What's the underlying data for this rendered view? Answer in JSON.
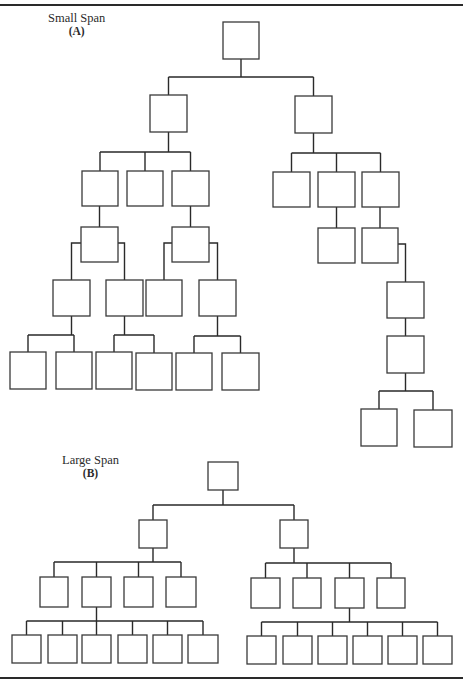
{
  "diagrams": [
    {
      "id": "small-span",
      "title": "Small Span",
      "sub": "(A)",
      "label_pos": [
        48,
        12
      ],
      "boxes": {
        "a0": [
          223,
          22,
          36,
          37
        ],
        "a1": [
          150,
          95,
          37,
          37
        ],
        "a2": [
          295,
          96,
          37,
          37
        ],
        "a3": [
          82,
          171,
          36,
          35
        ],
        "a4": [
          127,
          171,
          36,
          35
        ],
        "a5": [
          172,
          171,
          37,
          35
        ],
        "a6": [
          273,
          172,
          37,
          35
        ],
        "a7": [
          318,
          172,
          37,
          35
        ],
        "a8": [
          362,
          172,
          37,
          35
        ],
        "a9": [
          81,
          227,
          37,
          35
        ],
        "a10": [
          172,
          227,
          37,
          35
        ],
        "a11": [
          318,
          228,
          37,
          35
        ],
        "a12": [
          362,
          228,
          36,
          35
        ],
        "a13": [
          53,
          280,
          37,
          36
        ],
        "a14": [
          106,
          280,
          37,
          36
        ],
        "a15": [
          146,
          280,
          36,
          36
        ],
        "a16": [
          199,
          280,
          37,
          36
        ],
        "a17": [
          387,
          282,
          37,
          36
        ],
        "a18": [
          10,
          352,
          36,
          37
        ],
        "a19": [
          56,
          352,
          36,
          37
        ],
        "a20": [
          96,
          352,
          36,
          37
        ],
        "a21": [
          136,
          353,
          36,
          37
        ],
        "a22": [
          176,
          353,
          36,
          37
        ],
        "a23": [
          222,
          353,
          37,
          37
        ],
        "a24": [
          387,
          336,
          37,
          37
        ],
        "a25": [
          361,
          409,
          36,
          37
        ],
        "a26": [
          414,
          410,
          38,
          37
        ]
      },
      "edges": [
        {
          "type": "bus",
          "parent": "a0",
          "bus_y": 77,
          "children": [
            "a1",
            "a2"
          ]
        },
        {
          "type": "bus",
          "parent": "a1",
          "bus_y": 152,
          "children": [
            "a3",
            "a4",
            "a5"
          ]
        },
        {
          "type": "bus",
          "parent": "a2",
          "bus_y": 153,
          "children": [
            "a6",
            "a7",
            "a8"
          ]
        },
        {
          "type": "down",
          "parent": "a3",
          "child": "a9"
        },
        {
          "type": "down",
          "parent": "a5",
          "child": "a10"
        },
        {
          "type": "down",
          "parent": "a7",
          "child": "a11"
        },
        {
          "type": "down",
          "parent": "a8",
          "child": "a12"
        },
        {
          "type": "side",
          "parent": "a9",
          "side_y": 243,
          "children": [
            "a13",
            "a14"
          ]
        },
        {
          "type": "side",
          "parent": "a10",
          "side_y": 243,
          "children": [
            "a15",
            "a16"
          ]
        },
        {
          "type": "side",
          "parent": "a12",
          "side_y": 244,
          "children": [
            "a17"
          ]
        },
        {
          "type": "bus",
          "parent": "a13",
          "bus_y": 335,
          "children": [
            "a18",
            "a19"
          ]
        },
        {
          "type": "bus",
          "parent": "a14",
          "bus_y": 335,
          "children": [
            "a20",
            "a21"
          ]
        },
        {
          "type": "bus",
          "parent": "a16",
          "bus_y": 336,
          "children": [
            "a22",
            "a23"
          ]
        },
        {
          "type": "down",
          "parent": "a17",
          "child": "a24"
        },
        {
          "type": "bus",
          "parent": "a24",
          "bus_y": 391,
          "children": [
            "a25",
            "a26"
          ]
        }
      ]
    },
    {
      "id": "large-span",
      "title": "Large Span",
      "sub": "(B)",
      "label_pos": [
        62,
        454
      ],
      "boxes": {
        "b0": [
          208,
          462,
          30,
          28
        ],
        "b1": [
          139,
          520,
          28,
          28
        ],
        "b2": [
          280,
          520,
          28,
          28
        ],
        "b3": [
          40,
          577,
          28,
          30
        ],
        "b4": [
          82,
          577,
          29,
          30
        ],
        "b5": [
          124,
          577,
          29,
          30
        ],
        "b6": [
          166,
          577,
          30,
          30
        ],
        "b7": [
          251,
          578,
          29,
          30
        ],
        "b8": [
          293,
          578,
          28,
          30
        ],
        "b9": [
          335,
          578,
          29,
          30
        ],
        "b10": [
          377,
          578,
          28,
          30
        ],
        "b11": [
          12,
          635,
          29,
          28
        ],
        "b12": [
          48,
          635,
          29,
          28
        ],
        "b13": [
          82,
          635,
          29,
          28
        ],
        "b14": [
          118,
          635,
          29,
          28
        ],
        "b15": [
          153,
          635,
          29,
          28
        ],
        "b16": [
          188,
          635,
          30,
          28
        ],
        "b17": [
          247,
          636,
          29,
          28
        ],
        "b18": [
          283,
          636,
          29,
          28
        ],
        "b19": [
          318,
          636,
          29,
          28
        ],
        "b20": [
          353,
          636,
          29,
          28
        ],
        "b21": [
          388,
          636,
          29,
          28
        ],
        "b22": [
          423,
          636,
          29,
          28
        ]
      },
      "edges": [
        {
          "type": "bus",
          "parent": "b0",
          "bus_y": 505,
          "children": [
            "b1",
            "b2"
          ]
        },
        {
          "type": "bus",
          "parent": "b1",
          "bus_y": 562,
          "children": [
            "b3",
            "b4",
            "b5",
            "b6"
          ]
        },
        {
          "type": "bus",
          "parent": "b2",
          "bus_y": 563,
          "children": [
            "b7",
            "b8",
            "b9",
            "b10"
          ]
        },
        {
          "type": "bus",
          "parent": "b4",
          "bus_y": 621,
          "children": [
            "b11",
            "b12",
            "b13",
            "b14",
            "b15",
            "b16"
          ]
        },
        {
          "type": "bus",
          "parent": "b9",
          "bus_y": 622,
          "children": [
            "b17",
            "b18",
            "b19",
            "b20",
            "b21",
            "b22"
          ]
        }
      ]
    }
  ],
  "rules": {
    "top_y": 4,
    "bottom_y": 677
  }
}
